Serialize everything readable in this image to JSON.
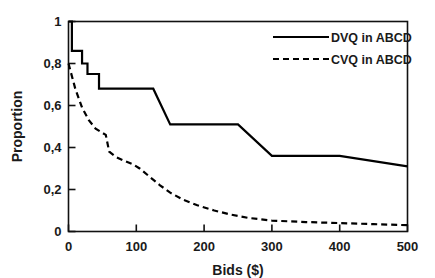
{
  "chart_data": {
    "type": "line",
    "title": "",
    "xlabel": "Bids ($)",
    "ylabel": "Proportion",
    "xlim": [
      0,
      500
    ],
    "ylim": [
      0,
      1
    ],
    "grid": false,
    "legend_position": "top-right",
    "xticks": [
      0,
      100,
      200,
      300,
      400,
      500
    ],
    "xtick_labels": [
      "0",
      "100",
      "200",
      "300",
      "400",
      "500"
    ],
    "yticks": [
      0,
      0.2,
      0.4,
      0.6,
      0.8,
      1
    ],
    "ytick_labels": [
      "0",
      "0,2",
      "0,4",
      "0,6",
      "0,8",
      "1"
    ],
    "series": [
      {
        "name": "DVQ in ABCD",
        "style": "solid",
        "color": "#000000",
        "points": [
          [
            0,
            1.0
          ],
          [
            5,
            1.0
          ],
          [
            5,
            0.86
          ],
          [
            20,
            0.86
          ],
          [
            20,
            0.8
          ],
          [
            28,
            0.8
          ],
          [
            28,
            0.75
          ],
          [
            45,
            0.75
          ],
          [
            45,
            0.68
          ],
          [
            125,
            0.68
          ],
          [
            150,
            0.51
          ],
          [
            250,
            0.51
          ],
          [
            300,
            0.36
          ],
          [
            400,
            0.36
          ],
          [
            500,
            0.31
          ]
        ]
      },
      {
        "name": "CVQ in ABCD",
        "style": "dashed",
        "color": "#000000",
        "points": [
          [
            0,
            0.8
          ],
          [
            10,
            0.68
          ],
          [
            20,
            0.59
          ],
          [
            30,
            0.53
          ],
          [
            40,
            0.49
          ],
          [
            50,
            0.47
          ],
          [
            55,
            0.46
          ],
          [
            60,
            0.38
          ],
          [
            70,
            0.355
          ],
          [
            80,
            0.34
          ],
          [
            95,
            0.32
          ],
          [
            105,
            0.3
          ],
          [
            120,
            0.26
          ],
          [
            135,
            0.22
          ],
          [
            150,
            0.185
          ],
          [
            170,
            0.15
          ],
          [
            190,
            0.125
          ],
          [
            215,
            0.1
          ],
          [
            240,
            0.08
          ],
          [
            265,
            0.065
          ],
          [
            300,
            0.052
          ],
          [
            350,
            0.045
          ],
          [
            400,
            0.04
          ],
          [
            450,
            0.035
          ],
          [
            500,
            0.03
          ]
        ]
      }
    ]
  },
  "legend": {
    "entries": [
      {
        "label": "DVQ in ABCD",
        "style": "solid"
      },
      {
        "label": "CVQ in ABCD",
        "style": "dashed"
      }
    ]
  }
}
